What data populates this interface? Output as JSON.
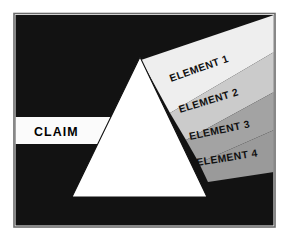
{
  "figure": {
    "frame": {
      "border_color": "#6b6b6b",
      "background_color": "#ffffff",
      "panel_color": "#121212"
    },
    "prism": {
      "name": "prism-triangle",
      "fill_color": "#ffffff",
      "edge_color": "#121212"
    },
    "input_beam": {
      "label": "CLAIM",
      "band_color": "#fbfbfb",
      "text_color": "#000000"
    },
    "output_beams": [
      {
        "label": "ELEMENT 1",
        "band_color": "#eeeeee",
        "text_color": "#111111"
      },
      {
        "label": "ELEMENT 2",
        "band_color": "#cbcbcb",
        "text_color": "#111111"
      },
      {
        "label": "ELEMENT 3",
        "band_color": "#a3a3a3",
        "text_color": "#111111"
      },
      {
        "label": "ELEMENT 4",
        "band_color": "#9a9a9a",
        "text_color": "#111111"
      }
    ]
  }
}
